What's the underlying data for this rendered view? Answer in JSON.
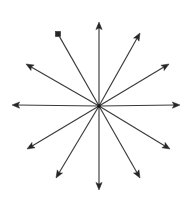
{
  "figure": {
    "background_color": "#ffffff",
    "line_color": "#3a3a3a",
    "arrowhead_color": "#262626",
    "line_width_px": 1.15,
    "canvas": {
      "width": 192,
      "height": 202
    },
    "center": {
      "x": 99,
      "y": 106
    },
    "arrow_count": 12,
    "angular_spacing_degrees": 30,
    "has_frame_border": false,
    "labels_visible": false
  },
  "chart_data": {
    "type": "scatter",
    "xlabel": "",
    "ylabel": "",
    "xlim": [
      0,
      192
    ],
    "ylim": [
      0,
      202
    ],
    "grid": false,
    "legend": "none",
    "center": {
      "x": 99,
      "y": 106
    },
    "rays": [
      {
        "name": "right",
        "angle_deg": 0,
        "tip": {
          "x": 180,
          "y": 105
        },
        "length_px": 81,
        "head": "open-v"
      },
      {
        "name": "upper-right-shallow",
        "angle_deg": 30,
        "tip": {
          "x": 169,
          "y": 64
        },
        "length_px": 81,
        "head": "open-v"
      },
      {
        "name": "upper-right-steep",
        "angle_deg": 60,
        "tip": {
          "x": 140,
          "y": 33
        },
        "length_px": 80,
        "head": "open-v"
      },
      {
        "name": "up",
        "angle_deg": 90,
        "tip": {
          "x": 99,
          "y": 22
        },
        "length_px": 84,
        "head": "open-v"
      },
      {
        "name": "upper-left-steep",
        "angle_deg": 120,
        "tip": {
          "x": 58,
          "y": 34
        },
        "length_px": 83,
        "head": "solid-blob"
      },
      {
        "name": "upper-left-shallow",
        "angle_deg": 150,
        "tip": {
          "x": 26,
          "y": 64
        },
        "length_px": 84,
        "head": "open-v"
      },
      {
        "name": "left",
        "angle_deg": 180,
        "tip": {
          "x": 12,
          "y": 105
        },
        "length_px": 87,
        "head": "open-v"
      },
      {
        "name": "lower-left-shallow",
        "angle_deg": 210,
        "tip": {
          "x": 27,
          "y": 149
        },
        "length_px": 84,
        "head": "open-v"
      },
      {
        "name": "lower-left-steep",
        "angle_deg": 240,
        "tip": {
          "x": 56,
          "y": 178
        },
        "length_px": 85,
        "head": "open-v"
      },
      {
        "name": "down",
        "angle_deg": 270,
        "tip": {
          "x": 99,
          "y": 190
        },
        "length_px": 84,
        "head": "open-v"
      },
      {
        "name": "lower-right-steep",
        "angle_deg": 300,
        "tip": {
          "x": 140,
          "y": 178
        },
        "length_px": 83,
        "head": "open-v"
      },
      {
        "name": "lower-right-shallow",
        "angle_deg": 330,
        "tip": {
          "x": 170,
          "y": 149
        },
        "length_px": 82,
        "head": "open-v"
      }
    ]
  }
}
